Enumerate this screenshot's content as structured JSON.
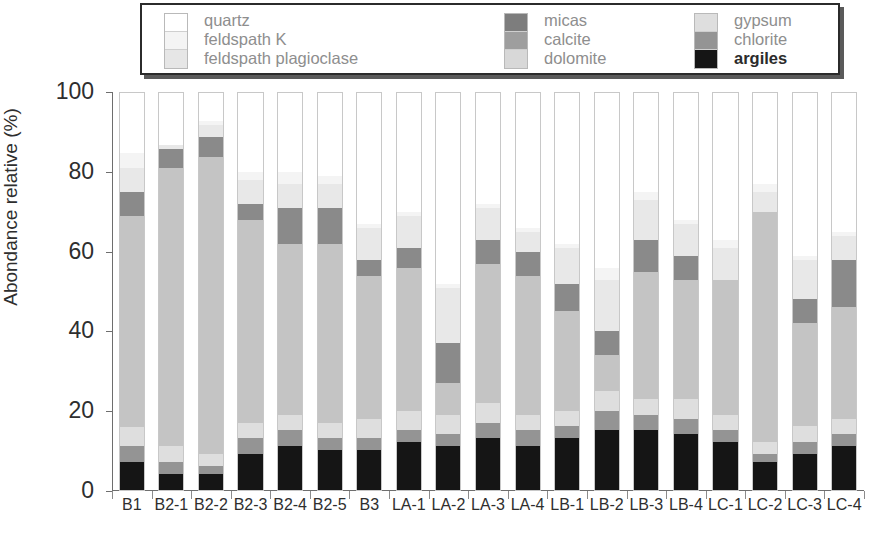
{
  "chart_data": {
    "type": "bar",
    "subtype": "stacked-bar-100",
    "title": "",
    "xlabel": "",
    "ylabel": "Abondance relative (%)",
    "ylim": [
      0,
      100
    ],
    "yticks": [
      0,
      20,
      40,
      60,
      80,
      100
    ],
    "grid": false,
    "legend_position": "top",
    "categories": [
      "B1",
      "B2-1",
      "B2-2",
      "B2-3",
      "B2-4",
      "B2-5",
      "B3",
      "LA-1",
      "LA-2",
      "LA-3",
      "LA-4",
      "LB-1",
      "LB-2",
      "LB-3",
      "LB-4",
      "LC-1",
      "LC-2",
      "LC-3",
      "LC-4"
    ],
    "series": [
      {
        "name": "argiles",
        "color": "#151515",
        "values": [
          7,
          4,
          4,
          9,
          11,
          10,
          10,
          12,
          11,
          13,
          11,
          13,
          15,
          15,
          14,
          12,
          7,
          9,
          11
        ]
      },
      {
        "name": "chlorite",
        "color": "#949494",
        "values": [
          4,
          3,
          2,
          4,
          4,
          3,
          3,
          3,
          3,
          4,
          4,
          3,
          5,
          4,
          4,
          3,
          2,
          3,
          3
        ]
      },
      {
        "name": "gypsum",
        "color": "#dedede",
        "values": [
          5,
          4,
          3,
          4,
          4,
          4,
          5,
          5,
          5,
          5,
          4,
          4,
          5,
          4,
          5,
          4,
          3,
          4,
          4
        ]
      },
      {
        "name": "dolomite",
        "color": "#c4c4c4",
        "values": [
          53,
          70,
          75,
          51,
          43,
          45,
          36,
          36,
          8,
          35,
          35,
          25,
          9,
          32,
          30,
          34,
          58,
          26,
          28
        ]
      },
      {
        "name": "calcite",
        "color": "#8a8a8a",
        "values": [
          6,
          5,
          5,
          4,
          9,
          9,
          4,
          5,
          10,
          6,
          6,
          7,
          6,
          8,
          6,
          0,
          0,
          6,
          12
        ]
      },
      {
        "name": "micas",
        "color": "#7d7d7d",
        "values": [
          0,
          0,
          0,
          0,
          0,
          0,
          0,
          0,
          0,
          0,
          0,
          0,
          0,
          0,
          0,
          0,
          0,
          0,
          0
        ]
      },
      {
        "name": "feldspath plagioclase",
        "color": "#e8e8e8",
        "values": [
          6,
          1,
          3,
          6,
          6,
          6,
          8,
          8,
          14,
          8,
          5,
          9,
          13,
          10,
          8,
          8,
          5,
          10,
          6
        ]
      },
      {
        "name": "feldspath K",
        "color": "#f4f4f4",
        "values": [
          4,
          0,
          1,
          2,
          3,
          2,
          1,
          1,
          1,
          1,
          1,
          1,
          3,
          2,
          1,
          2,
          2,
          1,
          1
        ]
      },
      {
        "name": "quartz",
        "color": "#ffffff",
        "values": [
          15,
          13,
          7,
          20,
          20,
          21,
          33,
          30,
          48,
          28,
          34,
          38,
          44,
          25,
          32,
          37,
          23,
          41,
          35
        ]
      }
    ],
    "stack_order_bottom_to_top": [
      "argiles",
      "chlorite",
      "gypsum",
      "dolomite",
      "calcite",
      "micas",
      "feldspath plagioclase",
      "feldspath K",
      "quartz"
    ]
  },
  "legend": {
    "columns": [
      {
        "swatches": [
          "quartz-swatch",
          "feldspath-k-swatch",
          "feldspath-plagioclase-swatch"
        ],
        "colors": [
          "#ffffff",
          "#f4f4f4",
          "#e6e6e6"
        ],
        "labels": [
          "quartz",
          "feldspath K",
          "feldspath plagioclase"
        ],
        "bold": [
          false,
          false,
          false
        ]
      },
      {
        "swatches": [
          "micas-swatch",
          "calcite-swatch",
          "dolomite-swatch"
        ],
        "colors": [
          "#7d7d7d",
          "#9e9e9e",
          "#d8d8d8"
        ],
        "labels": [
          "micas",
          "calcite",
          "dolomite"
        ],
        "bold": [
          false,
          false,
          false
        ]
      },
      {
        "swatches": [
          "gypsum-swatch",
          "chlorite-swatch",
          "argiles-swatch"
        ],
        "colors": [
          "#dedede",
          "#949494",
          "#151515"
        ],
        "labels": [
          "gypsum",
          "chlorite",
          "argiles"
        ],
        "bold": [
          false,
          false,
          true
        ]
      }
    ]
  },
  "axis": {
    "y_title": "Abondance relative (%)",
    "y_tick_labels": [
      "100",
      "80",
      "60",
      "40",
      "20",
      "0"
    ]
  }
}
